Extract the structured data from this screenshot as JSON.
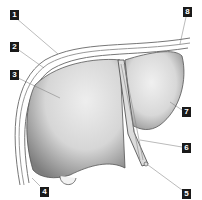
{
  "diagram": {
    "labels": [
      {
        "id": "1",
        "text": "1",
        "x": 10,
        "y": 10
      },
      {
        "id": "2",
        "text": "2",
        "x": 10,
        "y": 42
      },
      {
        "id": "3",
        "text": "3",
        "x": 10,
        "y": 70
      },
      {
        "id": "4",
        "text": "4",
        "x": 40,
        "y": 187
      },
      {
        "id": "5",
        "text": "5",
        "x": 182,
        "y": 189
      },
      {
        "id": "6",
        "text": "6",
        "x": 182,
        "y": 143
      },
      {
        "id": "7",
        "text": "7",
        "x": 182,
        "y": 107
      },
      {
        "id": "8",
        "text": "8",
        "x": 183,
        "y": 7
      }
    ],
    "colors": {
      "liver_light": "#e6e6e6",
      "liver_shadow": "#8a8a8a",
      "outline": "#555555",
      "label_bg": "#1a1a1a",
      "label_text": "#ffffff"
    }
  }
}
